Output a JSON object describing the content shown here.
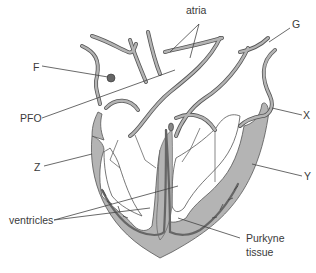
{
  "diagram": {
    "labels": {
      "atria": "atria",
      "G": "G",
      "F": "F",
      "PFO": "PFO",
      "X": "X",
      "Z": "Z",
      "Y": "Y",
      "ventricles": "ventricles",
      "purkyne_line1": "Purkyne",
      "purkyne_line2": "tissue"
    },
    "colors": {
      "wall_fill": "#b4b4b4",
      "wall_stroke": "#555555",
      "purkyne": "#6e6e6e",
      "leader": "#444444",
      "text": "#3a3a3a"
    }
  }
}
